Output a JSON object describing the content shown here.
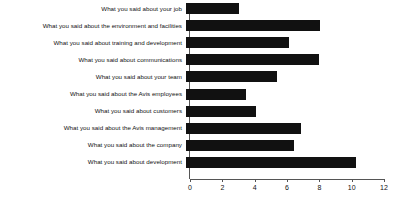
{
  "chart_data": {
    "type": "bar",
    "orientation": "horizontal",
    "title": "",
    "xlabel": "",
    "ylabel": "",
    "xlim": [
      0,
      12
    ],
    "xticks": [
      0,
      2,
      4,
      6,
      8,
      10,
      12
    ],
    "xtick_labels": [
      "0",
      "2",
      "4",
      "6",
      "8",
      "10",
      "12"
    ],
    "grid": false,
    "legend": null,
    "bar_color": "#111111",
    "axis_color": "#555555",
    "categories": [
      "What you said about your job",
      "What you said about the environment and facilities",
      "What you said about training and development",
      "What you said about communications",
      "What you said about your team",
      "What you said about the Avis employees",
      "What you said about customers",
      "What you said about the Avis management",
      "What you said about the company",
      "What you said about development"
    ],
    "values": [
      3.3,
      8.3,
      6.4,
      8.2,
      5.6,
      3.7,
      4.3,
      7.1,
      6.7,
      10.5
    ]
  }
}
